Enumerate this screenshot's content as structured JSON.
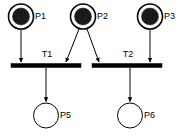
{
  "diagram": {
    "type": "petri-net",
    "background_color": "#ffffff",
    "stroke_color": "#000000",
    "token_color": "#1a1a1a",
    "places": [
      {
        "id": "P1",
        "label": "P1",
        "cx": 21,
        "cy": 16.5,
        "r_outer": 12.5,
        "r_inner": 8.5,
        "tokens": 1,
        "label_x": 35,
        "label_y": 16.5
      },
      {
        "id": "P2",
        "label": "P2",
        "cx": 83,
        "cy": 16.5,
        "r_outer": 12.5,
        "r_inner": 8.5,
        "tokens": 1,
        "label_x": 97,
        "label_y": 16.5
      },
      {
        "id": "P3",
        "label": "P3",
        "cx": 150,
        "cy": 16.5,
        "r_outer": 12.5,
        "r_inner": 8.5,
        "tokens": 1,
        "label_x": 164,
        "label_y": 16.5
      },
      {
        "id": "P5",
        "label": "P5",
        "cx": 46,
        "cy": 115.5,
        "r_outer": 12.5,
        "r_inner": 0,
        "tokens": 0,
        "label_x": 60,
        "label_y": 115.5
      },
      {
        "id": "P6",
        "label": "P6",
        "cx": 130,
        "cy": 115.5,
        "r_outer": 12.5,
        "r_inner": 0,
        "tokens": 0,
        "label_x": 144,
        "label_y": 115.5
      }
    ],
    "transitions": [
      {
        "id": "T1",
        "label": "T1",
        "x": 11,
        "y": 63.5,
        "width": 70,
        "height": 4,
        "label_x": 47,
        "label_y": 55
      },
      {
        "id": "T2",
        "label": "T2",
        "x": 92,
        "y": 63.5,
        "width": 70,
        "height": 4,
        "label_x": 128,
        "label_y": 55
      }
    ],
    "arcs": [
      {
        "id": "arc-p1-t1",
        "from": "P1",
        "to": "T1",
        "x1": 21,
        "y1": 29.5,
        "x2": 21,
        "y2": 62
      },
      {
        "id": "arc-p2-t1",
        "from": "P2",
        "to": "T1",
        "x1": 79,
        "y1": 29,
        "x2": 66,
        "y2": 62
      },
      {
        "id": "arc-p2-t2",
        "from": "P2",
        "to": "T2",
        "x1": 87,
        "y1": 29,
        "x2": 99,
        "y2": 62
      },
      {
        "id": "arc-p3-t2",
        "from": "P3",
        "to": "T2",
        "x1": 150,
        "y1": 29.5,
        "x2": 150,
        "y2": 62
      },
      {
        "id": "arc-t1-p5",
        "from": "T1",
        "to": "P5",
        "x1": 46,
        "y1": 68,
        "x2": 46,
        "y2": 101.5
      },
      {
        "id": "arc-t2-p6",
        "from": "T2",
        "to": "P6",
        "x1": 130,
        "y1": 68,
        "x2": 130,
        "y2": 101.5
      }
    ]
  }
}
